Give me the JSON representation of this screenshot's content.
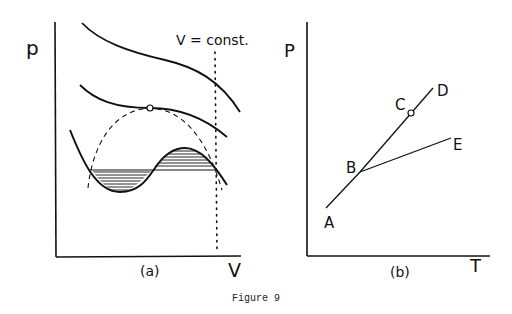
{
  "figure": {
    "caption": "Figure 9",
    "ink_color": "#111111",
    "background": "#ffffff"
  },
  "panel_a": {
    "label": "(a)",
    "y_axis_label": "p",
    "x_axis_label": "V",
    "annotation": "V = const.",
    "curves": [
      {
        "name": "isotherm-high-temperature",
        "style": "solid"
      },
      {
        "name": "isotherm-critical",
        "style": "solid",
        "critical_point_marker": "open-circle"
      },
      {
        "name": "isotherm-low-temperature-van-der-waals",
        "style": "solid",
        "maxwell_construction": "hatched equal-area regions"
      },
      {
        "name": "coexistence-dome",
        "style": "dashed"
      },
      {
        "name": "constant-volume-line",
        "style": "dotted"
      }
    ]
  },
  "panel_b": {
    "label": "(b)",
    "y_axis_label": "P",
    "x_axis_label": "T",
    "points": [
      {
        "id": "A",
        "label": "A"
      },
      {
        "id": "B",
        "label": "B"
      },
      {
        "id": "C",
        "label": "C",
        "marker": "open-circle"
      },
      {
        "id": "D",
        "label": "D"
      },
      {
        "id": "E",
        "label": "E"
      }
    ],
    "segments": [
      {
        "from": "A",
        "to": "B"
      },
      {
        "from": "B",
        "to": "D",
        "through": "C"
      },
      {
        "from": "B",
        "to": "E"
      }
    ]
  }
}
